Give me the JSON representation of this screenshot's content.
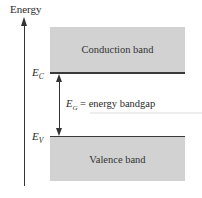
{
  "diagram": {
    "axis_label": "Energy",
    "conduction_band": {
      "label": "Conduction band",
      "fill": "#d2d2d2"
    },
    "valence_band": {
      "label": "Valence band",
      "fill": "#d2d2d2"
    },
    "ec_label": {
      "main": "E",
      "sub": "C"
    },
    "ev_label": {
      "main": "E",
      "sub": "V"
    },
    "gap": {
      "main": "E",
      "sub": "G",
      "text": " = energy bandgap"
    }
  }
}
